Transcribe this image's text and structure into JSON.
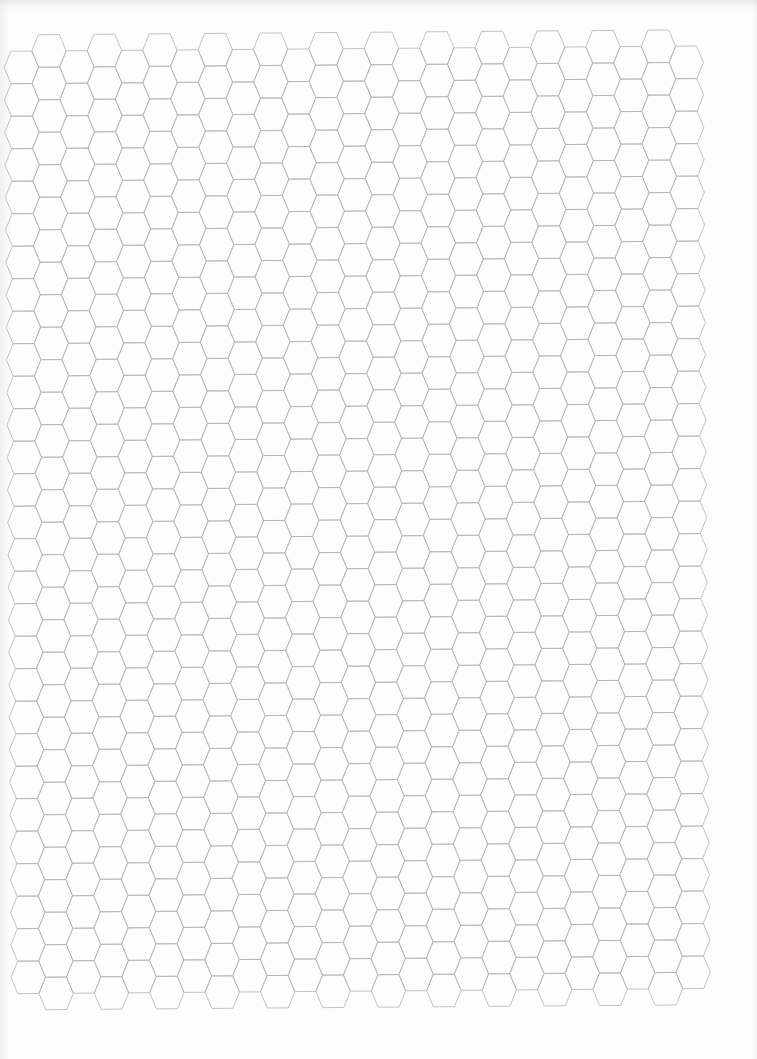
{
  "page": {
    "type": "hexagonal graph paper",
    "background_color": "#fdfdfd"
  },
  "grid": {
    "orientation": "flat-top",
    "line_color": "#b4b4b4",
    "line_width": 0.8,
    "columns": 25,
    "rows_in_high_columns": 30,
    "rows_in_low_columns": 29,
    "origin_x": 4,
    "origin_y": 35,
    "hex_slant_width": 6.7,
    "hex_top_edge": 21,
    "hex_height": 32.5,
    "column_spacing": 27.7,
    "rotation_deg": -0.43
  }
}
